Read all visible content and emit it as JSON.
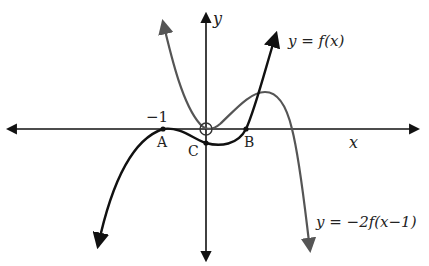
{
  "diagram": {
    "title": "",
    "axes": {
      "x_label": "x",
      "y_label": "y"
    },
    "curves": [
      {
        "name": "f",
        "label": "y = f(x)",
        "color": "#111111"
      },
      {
        "name": "g",
        "label": "y = −2f(x−1)",
        "color": "#555555"
      }
    ],
    "points": [
      {
        "name": "A",
        "label": "A",
        "x_value": "−1"
      },
      {
        "name": "B",
        "label": "B"
      },
      {
        "name": "C",
        "label": "C"
      },
      {
        "name": "origin",
        "label": ""
      }
    ],
    "tick_labels": {
      "minus_one": "−1"
    }
  },
  "labels": {
    "y_axis": "y",
    "x_axis": "x",
    "f_label": "y = f(x)",
    "g_label": "y = −2f(x−1)",
    "A": "A",
    "B": "B",
    "C": "C",
    "minus_one": "−1"
  }
}
